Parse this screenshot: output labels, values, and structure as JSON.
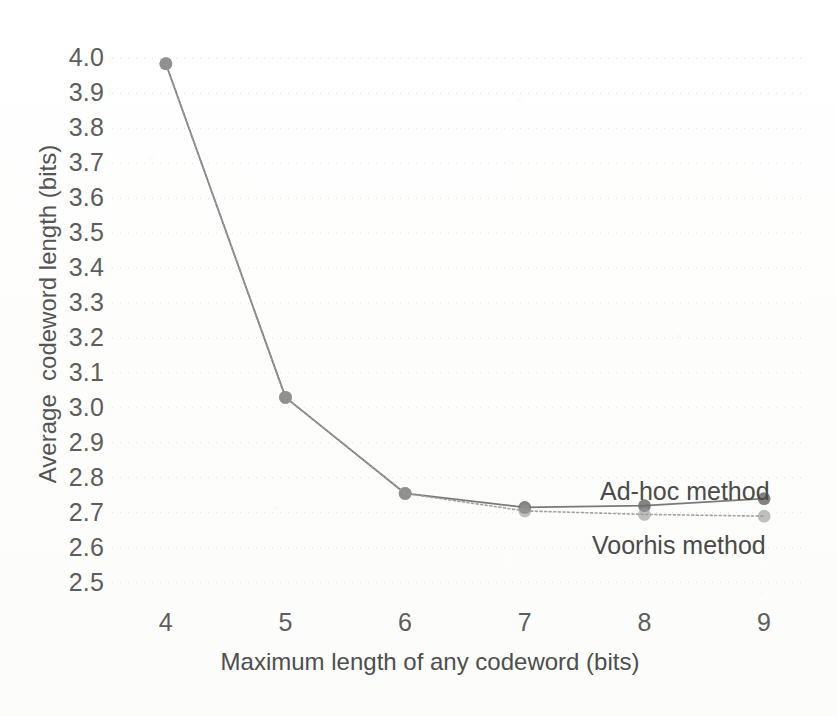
{
  "chart_data": {
    "type": "line",
    "title": "",
    "xlabel": "Maximum length of any codeword (bits)",
    "ylabel": "Average  codeword length (bits)",
    "x": [
      4,
      5,
      6,
      7,
      8,
      9
    ],
    "xlim": [
      3.6,
      9.35
    ],
    "ylim": [
      2.45,
      4.03
    ],
    "xticks": [
      "4",
      "5",
      "6",
      "7",
      "8",
      "9"
    ],
    "yticks": [
      "2.5",
      "2.6",
      "2.7",
      "2.8",
      "2.9",
      "3.0",
      "3.1",
      "3.2",
      "3.3",
      "3.4",
      "3.5",
      "3.6",
      "3.7",
      "3.8",
      "3.9",
      "4.0"
    ],
    "grid": "horizontal-dotted-faint",
    "legend_position": "inline-annotations",
    "series": [
      {
        "name": "Ad-hoc method",
        "values": [
          3.985,
          3.03,
          2.755,
          2.715,
          2.72,
          2.74
        ],
        "color": "#6e6e6e",
        "line_style": "solid",
        "marker": "circle"
      },
      {
        "name": "Voorhis method",
        "values": [
          3.985,
          3.03,
          2.755,
          2.705,
          2.695,
          2.69
        ],
        "color": "#9a9a9a",
        "line_style": "dotted",
        "marker": "circle"
      }
    ],
    "annotations": [
      {
        "text": "Ad-hoc method",
        "x": 8.0,
        "y": 2.8
      },
      {
        "text": "Voorhis method",
        "x": 8.0,
        "y": 2.63
      }
    ]
  },
  "axes": {
    "y_title": "Average  codeword length (bits)",
    "x_title": "Maximum length of any codeword (bits)"
  }
}
